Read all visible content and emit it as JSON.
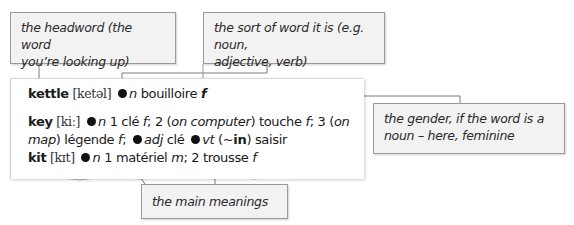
{
  "callouts": {
    "headword": {
      "line1": "the headword (the word",
      "line2": "you’re looking up)"
    },
    "word_type": {
      "line1": "the sort of word it is (e.g. noun,",
      "line2": "adjective, verb)"
    },
    "gender": {
      "line1": "the gender, if the word is a",
      "line2": "noun – here, feminine"
    },
    "meanings": {
      "text": "the main meanings"
    }
  },
  "entries": [
    {
      "headword": "kettle",
      "pronunciation": "[ketəl]",
      "parts": [
        "n",
        "bouilloire",
        "f"
      ]
    },
    {
      "headword": "key",
      "pronunciation": "[kiː]",
      "line1": {
        "pos": "n",
        "s1": "1 clé",
        "g1": "f",
        "s2": "; 2 (",
        "ctx2": "on computer",
        "s2b": ") touche",
        "g2": "f",
        "s3": "; 3 (",
        "ctx3": "on"
      },
      "line2": {
        "ctx3b": "map",
        "s3b": ") légende",
        "g3": "f",
        "s4": ";",
        "pos2": "adj",
        "s5": "clé",
        "pos3": "vt",
        "s6a": "(~",
        "phrasal": "in",
        "s6b": ")",
        "s7": "saisir"
      }
    },
    {
      "headword": "kit",
      "pronunciation": "[kɪt]",
      "pos": "n",
      "s1": "1 matériel",
      "g1": "m",
      "s2": "; 2 trousse",
      "g2": "f"
    }
  ],
  "colors": {
    "callout_bg": "#f2f2f2",
    "callout_border": "#9a9a9a",
    "leader": "#7a7a7a",
    "text": "#1a1a1a"
  }
}
